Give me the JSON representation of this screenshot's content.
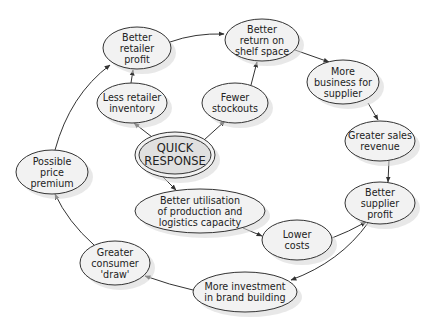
{
  "diagram": {
    "title_fragment": "",
    "nodes": [
      {
        "id": "quick-response",
        "lines": [
          "QUICK",
          "RESPONSE"
        ],
        "cx": 175,
        "cy": 155,
        "rx": 40,
        "ry": 23,
        "main": true
      },
      {
        "id": "less-retailer-inventory",
        "lines": [
          "Less retailer",
          "inventory"
        ],
        "cx": 132,
        "cy": 103,
        "rx": 35,
        "ry": 20
      },
      {
        "id": "fewer-stockouts",
        "lines": [
          "Fewer",
          "stockouts"
        ],
        "cx": 235,
        "cy": 103,
        "rx": 33,
        "ry": 20
      },
      {
        "id": "better-retailer-profit",
        "lines": [
          "Better",
          "retailer",
          "profit"
        ],
        "cx": 137,
        "cy": 48,
        "rx": 34,
        "ry": 21
      },
      {
        "id": "better-return-on-shelf-space",
        "lines": [
          "Better",
          "return on",
          "shelf space"
        ],
        "cx": 262,
        "cy": 40,
        "rx": 37,
        "ry": 21
      },
      {
        "id": "more-business-for-supplier",
        "lines": [
          "More",
          "business for",
          "supplier"
        ],
        "cx": 343,
        "cy": 82,
        "rx": 36,
        "ry": 22
      },
      {
        "id": "greater-sales-revenue",
        "lines": [
          "Greater sales",
          "revenue"
        ],
        "cx": 380,
        "cy": 141,
        "rx": 35,
        "ry": 20
      },
      {
        "id": "better-supplier-profit",
        "lines": [
          "Better",
          "supplier",
          "profit"
        ],
        "cx": 380,
        "cy": 203,
        "rx": 35,
        "ry": 21
      },
      {
        "id": "lower-costs",
        "lines": [
          "Lower",
          "costs"
        ],
        "cx": 297,
        "cy": 240,
        "rx": 35,
        "ry": 20
      },
      {
        "id": "better-utilisation",
        "lines": [
          "Better utilisation",
          "of production and",
          "logistics capacity"
        ],
        "cx": 200,
        "cy": 211,
        "rx": 65,
        "ry": 22
      },
      {
        "id": "more-investment-brand-building",
        "lines": [
          "More investment",
          "in brand building"
        ],
        "cx": 245,
        "cy": 292,
        "rx": 52,
        "ry": 20
      },
      {
        "id": "greater-consumer-draw",
        "lines": [
          "Greater",
          "consumer",
          "'draw'"
        ],
        "cx": 115,
        "cy": 263,
        "rx": 35,
        "ry": 22
      },
      {
        "id": "possible-price-premium",
        "lines": [
          "Possible",
          "price",
          "premium"
        ],
        "cx": 52,
        "cy": 172,
        "rx": 36,
        "ry": 22
      }
    ],
    "edges": [
      {
        "from": "quick-response",
        "to": "less-retailer-inventory",
        "d": "M152,137 L134,123"
      },
      {
        "from": "quick-response",
        "to": "fewer-stockouts",
        "d": "M204,140 L225,121"
      },
      {
        "from": "quick-response",
        "to": "better-utilisation",
        "d": "M163,177 L176,190"
      },
      {
        "from": "less-retailer-inventory",
        "to": "better-retailer-profit",
        "d": "M131,83 L133,70"
      },
      {
        "from": "fewer-stockouts",
        "to": "better-return-on-shelf-space",
        "d": "M251,85 L257,62"
      },
      {
        "from": "better-retailer-profit",
        "to": "better-return-on-shelf-space",
        "d": "M170,42 Q195,33 224,34"
      },
      {
        "from": "better-return-on-shelf-space",
        "to": "more-business-for-supplier",
        "d": "M295,50 L329,62"
      },
      {
        "from": "more-business-for-supplier",
        "to": "greater-sales-revenue",
        "d": "M368,103 L378,120"
      },
      {
        "from": "greater-sales-revenue",
        "to": "better-supplier-profit",
        "d": "M389,160 L388,182"
      },
      {
        "from": "better-utilisation",
        "to": "lower-costs",
        "d": "M243,228 L262,236"
      },
      {
        "from": "lower-costs",
        "to": "better-supplier-profit",
        "d": "M332,238 Q348,232 366,222"
      },
      {
        "from": "better-supplier-profit",
        "to": "more-investment-brand-building",
        "d": "M368,223 Q340,262 291,280"
      },
      {
        "from": "more-investment-brand-building",
        "to": "greater-consumer-draw",
        "d": "M193,290 Q170,285 145,276"
      },
      {
        "from": "greater-consumer-draw",
        "to": "possible-price-premium",
        "d": "M94,245 Q68,222 55,194"
      },
      {
        "from": "possible-price-premium",
        "to": "better-retailer-profit",
        "d": "M55,150 Q70,95 110,65"
      }
    ]
  }
}
